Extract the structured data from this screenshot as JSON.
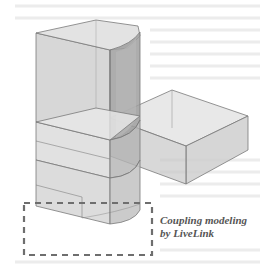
{
  "figure": {
    "annotation": {
      "line1": "Coupling modeling",
      "line2": "by LiveLink"
    },
    "colors": {
      "background": "#ffffff",
      "faint_text": "#e6e6e6",
      "edge": "#7a7a7a",
      "face_light": "#d9d9d9",
      "face_mid": "#c4c4c4",
      "face_dark": "#a9a9a9",
      "dashed_box": "#6e6e6e",
      "caption": "#555555"
    }
  }
}
